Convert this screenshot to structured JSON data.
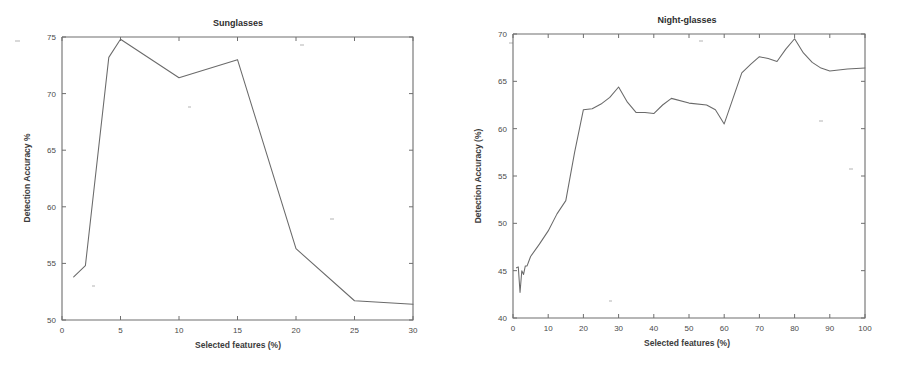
{
  "figure": {
    "background_color": "#ffffff",
    "line_color": "#6a6a6a",
    "axis_color": "#6e6e6e",
    "text_color": "#3c3c3c",
    "panel_count": 2
  },
  "panels": [
    {
      "id": "sunglasses",
      "title": "Sunglasses",
      "xlabel": "Selected features (%)",
      "ylabel": "Detection Accuracy %",
      "xticks": [
        "0",
        "5",
        "10",
        "15",
        "20",
        "25",
        "30"
      ],
      "yticks": [
        "50",
        "55",
        "60",
        "65",
        "70",
        "75"
      ]
    },
    {
      "id": "night-glasses",
      "title": "Night-glasses",
      "xlabel": "Selected features (%)",
      "ylabel": "Detection Accuracy (%)",
      "xticks": [
        "0",
        "10",
        "20",
        "30",
        "40",
        "50",
        "60",
        "70",
        "80",
        "90",
        "100"
      ],
      "yticks": [
        "40",
        "45",
        "50",
        "55",
        "60",
        "65",
        "70"
      ]
    }
  ],
  "chart_data": [
    {
      "type": "line",
      "title": "Sunglasses",
      "xlabel": "Selected features (%)",
      "ylabel": "Detection Accuracy %",
      "xlim": [
        0,
        30
      ],
      "ylim": [
        50,
        75
      ],
      "xticks": [
        0,
        5,
        10,
        15,
        20,
        25,
        30
      ],
      "yticks": [
        50,
        55,
        60,
        65,
        70,
        75
      ],
      "grid": false,
      "legend": false,
      "series": [
        {
          "name": "Sunglasses detection accuracy",
          "x": [
            1,
            2,
            4,
            5,
            10,
            15,
            20,
            25,
            30
          ],
          "values": [
            53.8,
            54.8,
            73.2,
            74.8,
            71.4,
            73.0,
            56.3,
            51.7,
            51.4
          ]
        }
      ]
    },
    {
      "type": "line",
      "title": "Night-glasses",
      "xlabel": "Selected features (%)",
      "ylabel": "Detection Accuracy (%)",
      "xlim": [
        0,
        100
      ],
      "ylim": [
        40,
        70
      ],
      "xticks": [
        0,
        10,
        20,
        30,
        40,
        50,
        60,
        70,
        80,
        90,
        100
      ],
      "yticks": [
        40,
        45,
        50,
        55,
        60,
        65,
        70
      ],
      "grid": false,
      "legend": false,
      "series": [
        {
          "name": "Night-glasses detection accuracy",
          "x": [
            1,
            1.5,
            2,
            2.5,
            3,
            3.5,
            4,
            5,
            7.5,
            10,
            12.5,
            15,
            17.5,
            20,
            22.5,
            25,
            27.5,
            30,
            32.5,
            35,
            37.5,
            40,
            42.5,
            45,
            50,
            55,
            57.5,
            60,
            62.5,
            65,
            67.5,
            70,
            72.5,
            75,
            77.5,
            80,
            82.5,
            85,
            87.5,
            90,
            95,
            100
          ],
          "values": [
            45.3,
            45.4,
            42.7,
            45.0,
            44.6,
            45.5,
            45.5,
            46.5,
            47.8,
            49.2,
            51.0,
            52.4,
            57.5,
            62.0,
            62.1,
            62.6,
            63.3,
            64.4,
            62.8,
            61.7,
            61.7,
            61.6,
            62.5,
            63.2,
            62.7,
            62.5,
            62.0,
            60.5,
            63.2,
            65.9,
            66.8,
            67.6,
            67.4,
            67.1,
            68.4,
            69.5,
            68.0,
            67.0,
            66.4,
            66.1,
            66.3,
            66.4
          ]
        }
      ]
    }
  ]
}
